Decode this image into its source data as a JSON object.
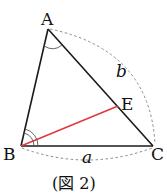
{
  "figure": {
    "caption": "(図 2)",
    "vertices": {
      "A": {
        "label": "A",
        "x": 48,
        "y": 29
      },
      "B": {
        "label": "B",
        "x": 21,
        "y": 146
      },
      "C": {
        "label": "C",
        "x": 153,
        "y": 146
      },
      "E": {
        "label": "E",
        "x": 118,
        "y": 106
      }
    },
    "side_labels": {
      "a": "a",
      "b": "b"
    },
    "colors": {
      "triangle": "#1a1a1a",
      "segment_BE": "#e0363c",
      "dashed_arc": "#888888"
    }
  }
}
